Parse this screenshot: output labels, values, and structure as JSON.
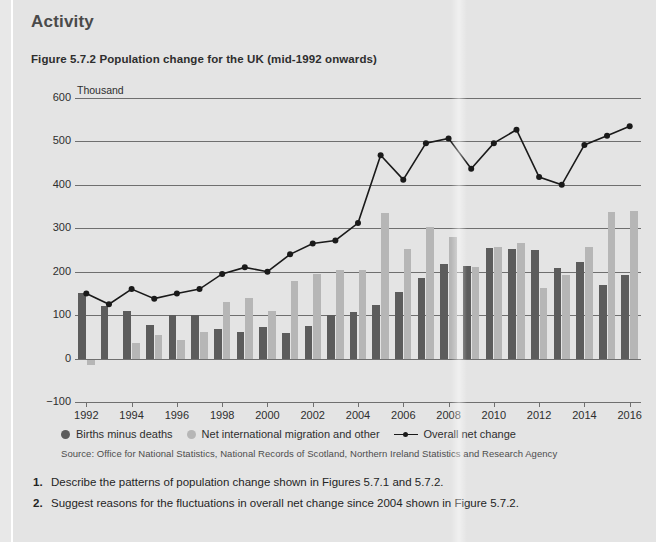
{
  "panel": {
    "activity_heading": "Activity",
    "figure_title": "Figure 5.7.2 Population change for the UK (mid-1992 onwards)"
  },
  "legend": {
    "items": [
      {
        "label": "Births minus deaths",
        "marker": "dot",
        "color": "#5c5c5c"
      },
      {
        "label": "Net international migration and other",
        "marker": "dot",
        "color": "#b6b6b6"
      },
      {
        "label": "Overall net change",
        "marker": "line-dot",
        "color": "#1a1a1a"
      }
    ]
  },
  "source": "Source: Office for National Statistics, National Records of Scotland, Northern Ireland Statistics and Research Agency",
  "questions": [
    {
      "number": "1.",
      "text": "Describe the patterns of population change shown in Figures 5.7.1 and 5.7.2."
    },
    {
      "number": "2.",
      "text": "Suggest reasons for the fluctuations in overall net change since 2004 shown in Figure 5.7.2."
    }
  ],
  "colors": {
    "panel_background": "#e4e4e4",
    "page_background": "#e8e8e8",
    "bar_dark": "#5c5c5c",
    "bar_light": "#b6b6b6",
    "line": "#1a1a1a",
    "gridline": "#6f6f6f",
    "text": "#2e2e2e",
    "heading": "#4a4a4a"
  },
  "chart_data": {
    "type": "bar",
    "title": "Figure 5.7.2 Population change for the UK (mid-1992 onwards)",
    "xlabel": "",
    "ylabel": "Thousand",
    "y_unit_label": "Thousand",
    "ylim": [
      -100,
      600
    ],
    "yticks": [
      -100,
      0,
      100,
      200,
      300,
      400,
      500,
      600
    ],
    "ytick_labels": [
      "-100",
      "0",
      "100",
      "200",
      "300",
      "400",
      "500",
      "600"
    ],
    "grid": true,
    "legend_position": "below-plot-left",
    "categories": [
      1992,
      1993,
      1994,
      1995,
      1996,
      1997,
      1998,
      1999,
      2000,
      2001,
      2002,
      2003,
      2004,
      2005,
      2006,
      2007,
      2008,
      2009,
      2010,
      2011,
      2012,
      2013,
      2014,
      2015,
      2016
    ],
    "xtick_labels": [
      "1992",
      "1994",
      "1996",
      "1998",
      "2000",
      "2002",
      "2004",
      "2006",
      "2008",
      "2010",
      "2012",
      "2014",
      "2016"
    ],
    "xtick_values": [
      1992,
      1994,
      1996,
      1998,
      2000,
      2002,
      2004,
      2006,
      2008,
      2010,
      2012,
      2014,
      2016
    ],
    "series": [
      {
        "name": "Births minus deaths",
        "kind": "bar",
        "color": "#5c5c5c",
        "values": [
          150,
          122,
          110,
          78,
          100,
          100,
          68,
          62,
          72,
          60,
          76,
          100,
          108,
          124,
          154,
          185,
          217,
          214,
          255,
          253,
          250,
          208,
          222,
          169,
          192
        ]
      },
      {
        "name": "Net international migration and other",
        "kind": "bar",
        "color": "#b6b6b6",
        "values": [
          -15,
          0,
          35,
          55,
          42,
          62,
          130,
          140,
          110,
          178,
          195,
          205,
          205,
          335,
          253,
          303,
          280,
          212,
          256,
          267,
          162,
          192,
          258,
          338,
          341
        ]
      },
      {
        "name": "Overall net change",
        "kind": "line",
        "color": "#1a1a1a",
        "values": [
          150,
          125,
          160,
          138,
          150,
          160,
          195,
          210,
          200,
          240,
          265,
          272,
          312,
          468,
          412,
          496,
          507,
          437,
          496,
          527,
          418,
          400,
          492,
          513,
          535
        ]
      }
    ]
  }
}
